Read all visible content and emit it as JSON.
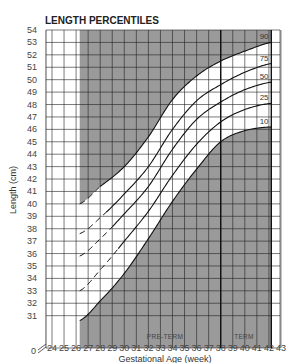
{
  "chart_data": {
    "type": "line",
    "title": "LENGTH PERCENTILES",
    "xlabel": "Gestational Age (week)",
    "ylabel": "Length (cm)",
    "xlim": [
      23.5,
      43.5
    ],
    "ylim": [
      30,
      54
    ],
    "x_ticks": [
      24,
      25,
      26,
      27,
      28,
      29,
      30,
      31,
      32,
      33,
      34,
      35,
      36,
      37,
      38,
      39,
      40,
      41,
      42,
      43
    ],
    "y_ticks": [
      31,
      32,
      33,
      34,
      35,
      36,
      37,
      38,
      39,
      40,
      41,
      42,
      43,
      44,
      45,
      46,
      47,
      48,
      49,
      50,
      51,
      52,
      53,
      54
    ],
    "y_axis_break_label": "0",
    "grid": true,
    "shaded_regions": [
      "above 90th percentile",
      "below 10th percentile"
    ],
    "region_labels": [
      "PRE-TERM",
      "TERM"
    ],
    "term_boundary_week": 38,
    "x": [
      26.3,
      28,
      30,
      32,
      34,
      36,
      38,
      40,
      42.2
    ],
    "series": [
      {
        "name": "90",
        "values": [
          40.0,
          41.4,
          43.0,
          45.4,
          48.4,
          50.3,
          51.5,
          52.3,
          53.0
        ],
        "dashed_until_week": 28
      },
      {
        "name": "75",
        "values": [
          37.6,
          38.9,
          40.8,
          43.0,
          46.0,
          48.3,
          49.6,
          50.6,
          51.3
        ],
        "dashed_until_week": 28.5
      },
      {
        "name": "50",
        "values": [
          35.8,
          37.2,
          39.2,
          41.4,
          44.4,
          46.8,
          48.2,
          49.2,
          49.8
        ],
        "dashed_until_week": 29
      },
      {
        "name": "25",
        "values": [
          33.0,
          34.7,
          37.0,
          39.4,
          42.3,
          44.8,
          46.6,
          47.6,
          48.1
        ],
        "dashed_until_week": 29.5
      },
      {
        "name": "10",
        "values": [
          30.6,
          32.2,
          34.4,
          37.2,
          40.2,
          42.8,
          45.0,
          45.9,
          46.2
        ],
        "dashed_until_week": 26.3
      }
    ]
  },
  "labels": {
    "title": "LENGTH PERCENTILES",
    "xlabel": "Gestational Age (week)",
    "ylabel": "Length (cm)",
    "preterm": "PRE-TERM",
    "term": "TERM",
    "axis_break": "0"
  }
}
